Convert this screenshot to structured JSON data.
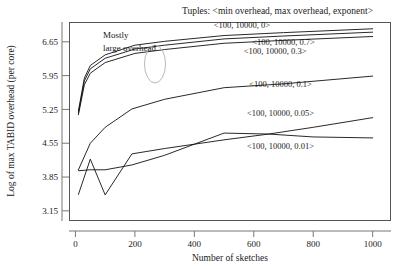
{
  "chart_data": {
    "type": "line",
    "title": "Tuples: <min overhead, max overhead, exponent>",
    "xlabel": "Number of sketches",
    "ylabel": "Log of max TABID overhead (per core)",
    "xlim": [
      -20,
      1060
    ],
    "ylim": [
      2.95,
      7.05
    ],
    "xticks": [
      0,
      200,
      400,
      600,
      800,
      1000
    ],
    "yticks": [
      3.15,
      3.85,
      4.55,
      5.25,
      5.95,
      6.65
    ],
    "xtick_labels": [
      "0",
      "200",
      "400",
      "600",
      "800",
      "1000"
    ],
    "ytick_labels": [
      "3.15",
      "3.85",
      "4.55",
      "5.25",
      "5.95",
      "6.65"
    ],
    "grid": false,
    "legend_position": "inline-right-annotations",
    "annotations": [
      {
        "id": "mostly-large-overhead",
        "line1": "Mostly",
        "line2": "large overhead",
        "x": 60,
        "y": 6.95
      }
    ],
    "series": [
      {
        "name": "<100, 10000, 0>",
        "label": "<100, 10000, 0>",
        "label_x": 560,
        "label_y": 6.93,
        "x": [
          10,
          30,
          50,
          100,
          200,
          300,
          500,
          700,
          1000
        ],
        "y": [
          5.22,
          5.9,
          6.16,
          6.38,
          6.58,
          6.66,
          6.78,
          6.84,
          6.92
        ]
      },
      {
        "name": "<100, 10000, 0.7>",
        "label": "<100, 10000, 0.7>",
        "label_x": 700,
        "label_y": 6.58,
        "x": [
          10,
          30,
          50,
          100,
          200,
          300,
          500,
          700,
          1000
        ],
        "y": [
          5.18,
          5.84,
          6.09,
          6.31,
          6.5,
          6.58,
          6.71,
          6.77,
          6.85
        ]
      },
      {
        "name": "<100, 10000, 0.3>",
        "label": "<100, 10000, 0.3>",
        "label_x": 672,
        "label_y": 6.4,
        "x": [
          10,
          30,
          50,
          100,
          200,
          300,
          500,
          700,
          1000
        ],
        "y": [
          5.14,
          5.76,
          6.0,
          6.22,
          6.41,
          6.49,
          6.62,
          6.68,
          6.76
        ]
      },
      {
        "name": "<100, 10000, 0.1>",
        "label": "<100, 10000, 0.1>",
        "label_x": 690,
        "label_y": 5.72,
        "x": [
          10,
          50,
          100,
          190,
          300,
          500,
          700,
          1000
        ],
        "y": [
          4.0,
          4.55,
          4.88,
          5.26,
          5.46,
          5.7,
          5.78,
          5.94
        ]
      },
      {
        "name": "<100, 10000, 0.05>",
        "label": "<100, 10000, 0.05>",
        "label_x": 690,
        "label_y": 5.12,
        "x": [
          10,
          50,
          100,
          190,
          300,
          500,
          650,
          800,
          1000
        ],
        "y": [
          3.49,
          4.22,
          3.48,
          4.33,
          4.44,
          4.62,
          4.74,
          4.88,
          5.08
        ]
      },
      {
        "name": "<100, 10000, 0.01>",
        "label": "<100, 10000, 0.01>",
        "label_x": 690,
        "label_y": 4.44,
        "x": [
          10,
          50,
          100,
          190,
          300,
          500,
          650,
          800,
          1000
        ],
        "y": [
          3.98,
          4.0,
          4.0,
          4.1,
          4.3,
          4.76,
          4.74,
          4.68,
          4.66
        ]
      }
    ]
  }
}
